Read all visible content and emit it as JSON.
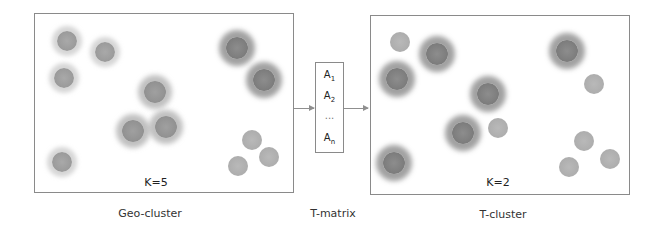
{
  "left_panel": {
    "k_label": "K=5",
    "caption": "Geo-cluster",
    "points": [
      {
        "x": 67,
        "y": 41,
        "style": "halo-light"
      },
      {
        "x": 105,
        "y": 52,
        "style": "halo-light"
      },
      {
        "x": 64,
        "y": 78,
        "style": "halo-light"
      },
      {
        "x": 155,
        "y": 92,
        "style": "halo-mid"
      },
      {
        "x": 133,
        "y": 131,
        "style": "halo-mid"
      },
      {
        "x": 166,
        "y": 127,
        "style": "halo-mid"
      },
      {
        "x": 62,
        "y": 162,
        "style": "halo-light"
      },
      {
        "x": 237,
        "y": 48,
        "style": "halo-dark"
      },
      {
        "x": 264,
        "y": 80,
        "style": "halo-dark"
      },
      {
        "x": 252,
        "y": 140,
        "style": "plain"
      },
      {
        "x": 269,
        "y": 157,
        "style": "plain"
      },
      {
        "x": 238,
        "y": 166,
        "style": "plain"
      }
    ]
  },
  "t_matrix": {
    "caption": "T-matrix",
    "items": [
      {
        "base": "A",
        "sub": "1"
      },
      {
        "base": "A",
        "sub": "2"
      },
      {
        "base": "...",
        "sub": ""
      },
      {
        "base": "A",
        "sub": "n"
      }
    ]
  },
  "right_panel": {
    "k_label": "K=2",
    "caption": "T-cluster",
    "points": [
      {
        "x": 400,
        "y": 42,
        "style": "plain"
      },
      {
        "x": 437,
        "y": 54,
        "style": "halo-dark"
      },
      {
        "x": 397,
        "y": 79,
        "style": "halo-dark"
      },
      {
        "x": 488,
        "y": 94,
        "style": "halo-dark"
      },
      {
        "x": 463,
        "y": 133,
        "style": "halo-dark"
      },
      {
        "x": 498,
        "y": 128,
        "style": "plain"
      },
      {
        "x": 394,
        "y": 163,
        "style": "halo-dark"
      },
      {
        "x": 567,
        "y": 51,
        "style": "halo-dark"
      },
      {
        "x": 594,
        "y": 84,
        "style": "plain"
      },
      {
        "x": 584,
        "y": 141,
        "style": "plain"
      },
      {
        "x": 610,
        "y": 159,
        "style": "plain"
      },
      {
        "x": 569,
        "y": 167,
        "style": "plain"
      }
    ]
  }
}
